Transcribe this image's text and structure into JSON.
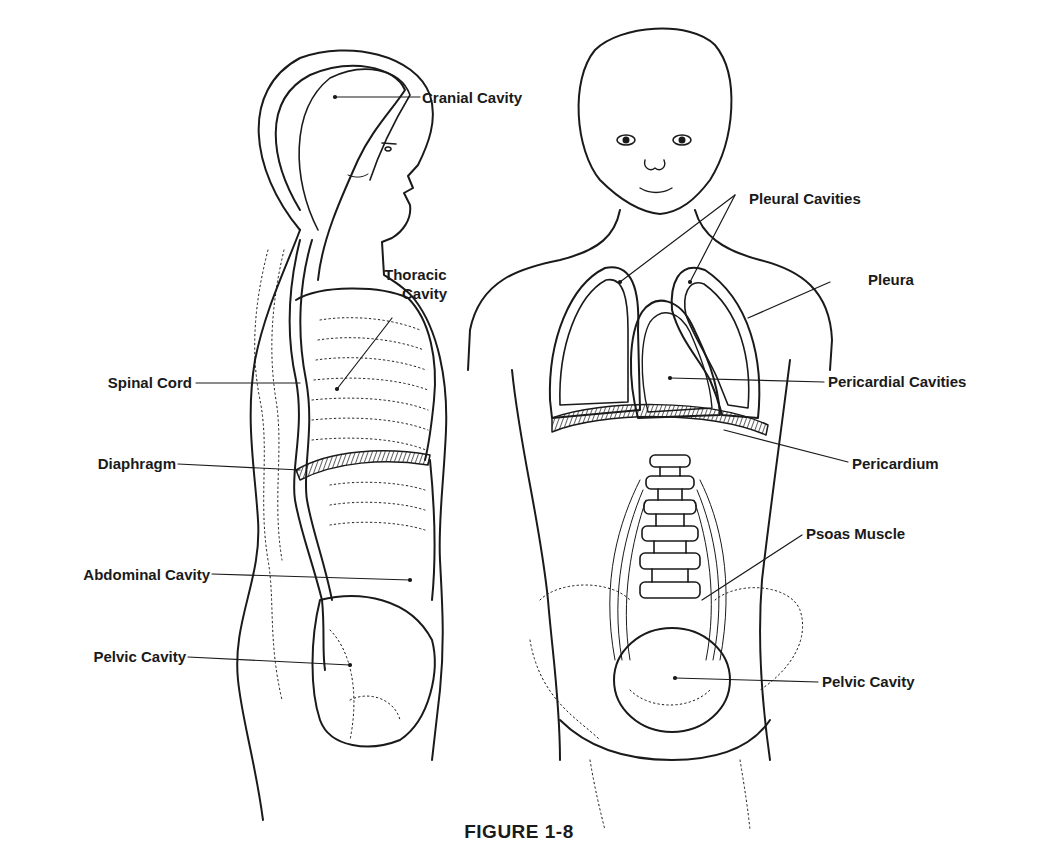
{
  "figure": {
    "caption": "FIGURE 1-8",
    "ink_color": "#1a1a1a",
    "background": "#ffffff"
  },
  "side_view": {
    "labels": {
      "cranial_cavity": "Cranial Cavity",
      "thoracic_cavity_line1": "Thoracic",
      "thoracic_cavity_line2": "Cavity",
      "spinal_cord": "Spinal Cord",
      "diaphragm": "Diaphragm",
      "abdominal_cavity": "Abdominal Cavity",
      "pelvic_cavity": "Pelvic Cavity"
    }
  },
  "front_view": {
    "labels": {
      "pleural_cavities": "Pleural Cavities",
      "pleura": "Pleura",
      "pericardial_cavities": "Pericardial Cavities",
      "pericardium": "Pericardium",
      "psoas_muscle": "Psoas Muscle",
      "pelvic_cavity": "Pelvic Cavity"
    }
  }
}
